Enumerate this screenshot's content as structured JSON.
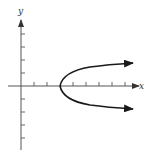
{
  "figure": {
    "x_axis_label": "x",
    "y_axis_label": "y",
    "colors": {
      "axis": "#555555",
      "curve": "#1a1a1a",
      "background": "#ffffff"
    },
    "origin_px": [
      21,
      86
    ],
    "unit_px": 13,
    "x_ticks_positive": [
      1,
      2,
      3,
      4,
      5,
      6,
      7,
      8
    ],
    "y_ticks": [
      -4,
      -3,
      -2,
      -1,
      1,
      2,
      3,
      4
    ],
    "curve": {
      "type": "parabola",
      "opens": "right",
      "vertex": [
        3,
        0
      ],
      "equation_approx": "x = 3 + 2y^2",
      "arrows": [
        "upper-right",
        "lower-right"
      ]
    }
  }
}
